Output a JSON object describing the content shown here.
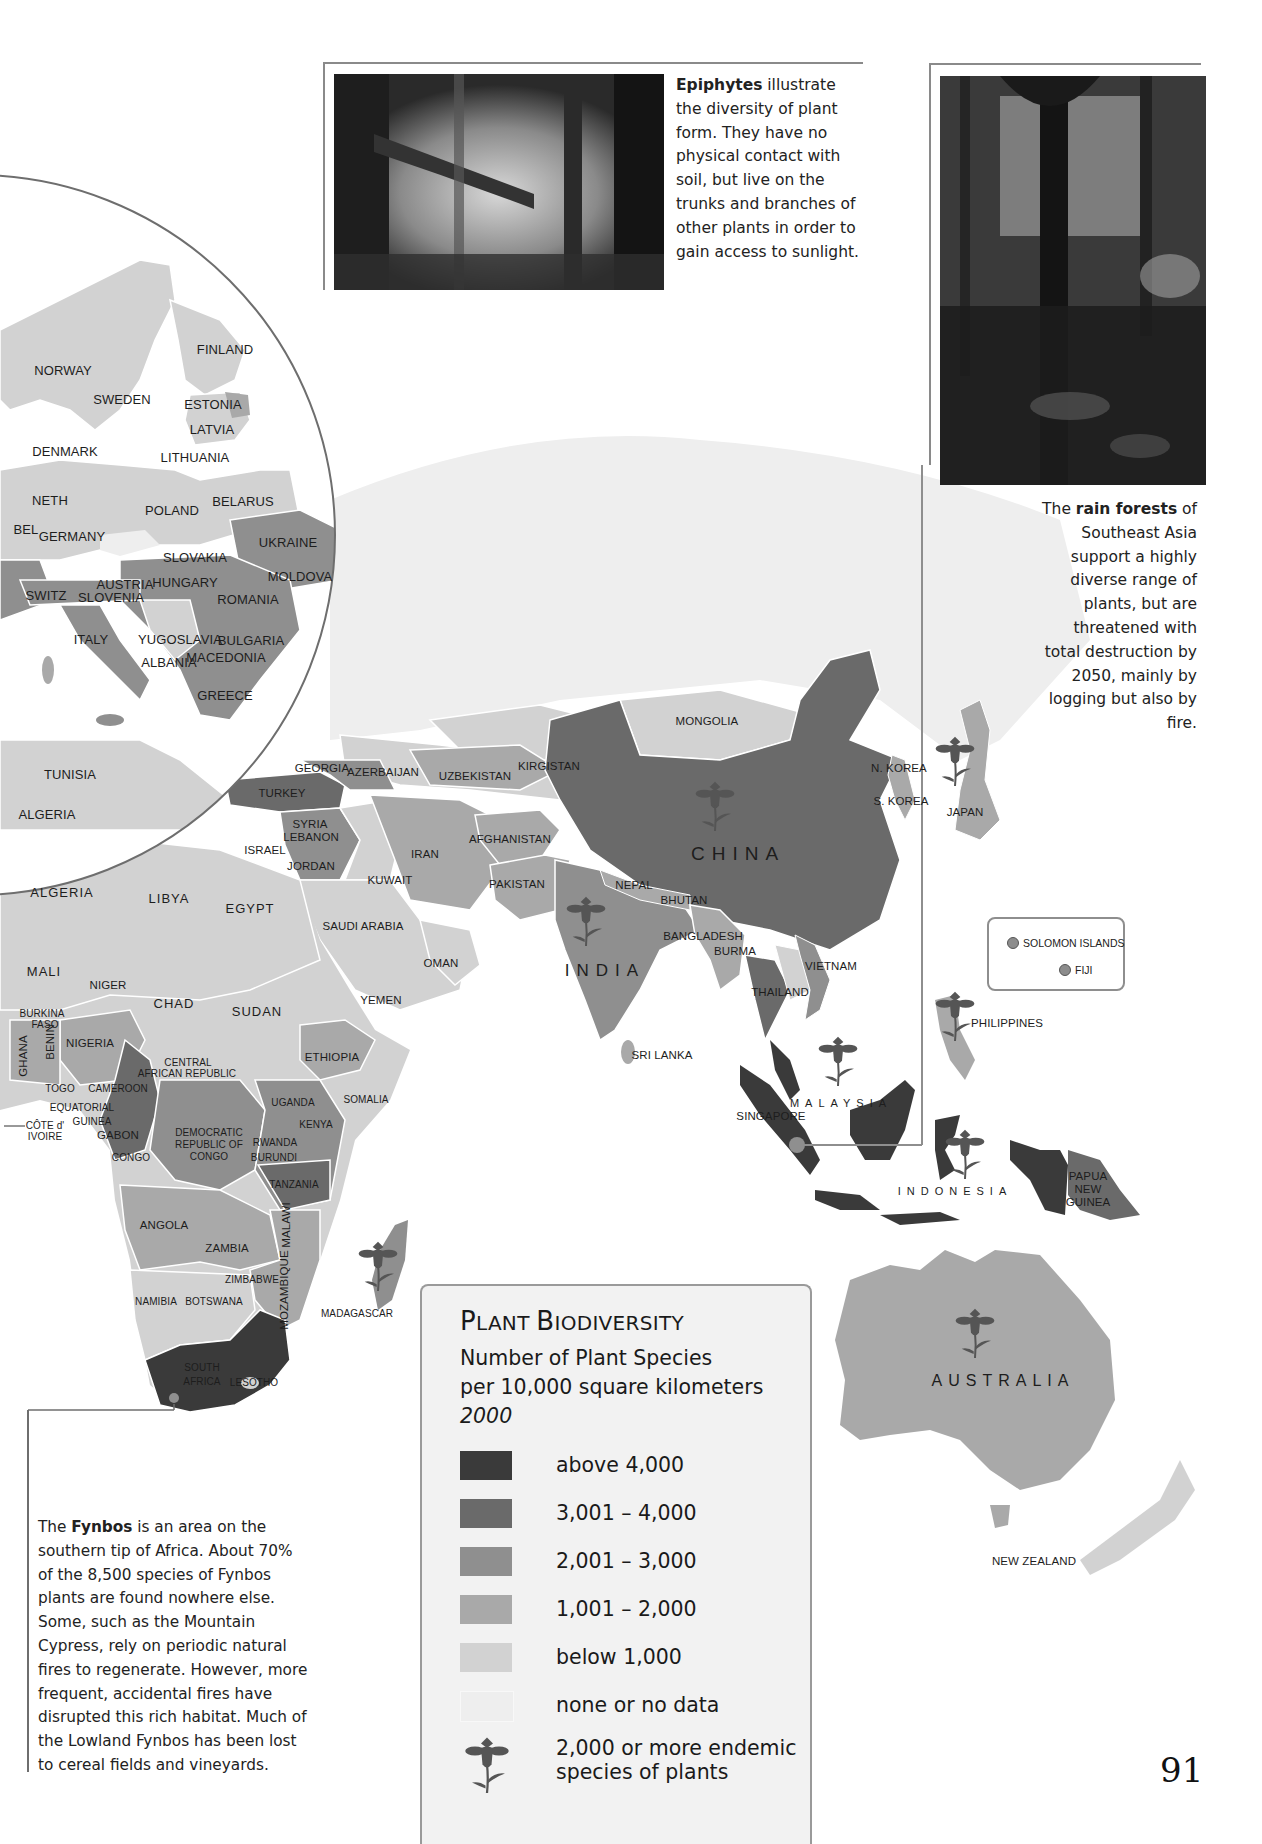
{
  "page": {
    "number": "91"
  },
  "colors": {
    "above_4000": "#3a3a3a",
    "r3001_4000": "#6a6a6a",
    "r2001_3000": "#8f8f8f",
    "r1001_2000": "#a9a9a9",
    "below_1000": "#d2d2d2",
    "no_data": "#eeeeee",
    "flower": "#555555",
    "ocean": "#ffffff",
    "border": "#ffffff"
  },
  "captions": {
    "epiphytes": {
      "bold": "Epiphytes",
      "text": " illustrate the diversity of plant form. They have no physical contact with soil, but live on the trunks and branches of other plants in order to gain access to sunlight."
    },
    "rainforests": {
      "pre": "The ",
      "bold": "rain forests",
      "text": " of Southeast Asia support a highly diverse range of plants, but are threatened with total destruction by 2050, mainly by logging but also by fire."
    },
    "fynbos": {
      "pre": "The ",
      "bold": "Fynbos",
      "text": " is an area on the southern tip of Africa. About 70% of the 8,500 species of Fynbos plants are found nowhere else. Some, such as the Mountain Cypress, rely on periodic natural fires to regenerate. However, more frequent, accidental fires have disrupted this rich habitat. Much of the Lowland Fynbos has been lost to cereal fields and vineyards."
    }
  },
  "photos": {
    "epiphytes": {
      "alt": "Misty forest with epiphytes on tree branches"
    },
    "rainforest": {
      "alt": "Dense Southeast Asian rain forest"
    }
  },
  "legend": {
    "title_cap1": "P",
    "title_rest1": "LANT ",
    "title_cap2": "B",
    "title_rest2": "IODIVERSITY",
    "subtitle1": "Number of Plant Species",
    "subtitle2": "per 10,000 square kilometers",
    "year": "2000",
    "items": [
      {
        "label": "above 4,000",
        "color": "#3a3a3a"
      },
      {
        "label": "3,001 – 4,000",
        "color": "#6a6a6a"
      },
      {
        "label": "2,001 – 3,000",
        "color": "#8f8f8f"
      },
      {
        "label": "1,001 – 2,000",
        "color": "#a9a9a9"
      },
      {
        "label": "below 1,000",
        "color": "#d2d2d2"
      },
      {
        "label": "none or no data",
        "color": "#eeeeee"
      }
    ],
    "endemic_label_1": "2,000 or more endemic",
    "endemic_label_2": "species of plants"
  },
  "inset": {
    "items": [
      {
        "label": "SOLOMON ISLANDS"
      },
      {
        "label": "FIJI"
      }
    ]
  },
  "map": {
    "europe_labels": [
      {
        "text": "FINLAND",
        "x": 225,
        "y": 350
      },
      {
        "text": "NORWAY",
        "x": 63,
        "y": 371
      },
      {
        "text": "SWEDEN",
        "x": 122,
        "y": 400
      },
      {
        "text": "ESTONIA",
        "x": 213,
        "y": 405
      },
      {
        "text": "LATVIA",
        "x": 212,
        "y": 430
      },
      {
        "text": "LITHUANIA",
        "x": 195,
        "y": 458
      },
      {
        "text": "DENMARK",
        "x": 65,
        "y": 452
      },
      {
        "text": "NETH",
        "x": 50,
        "y": 501
      },
      {
        "text": "POLAND",
        "x": 172,
        "y": 511
      },
      {
        "text": "BELARUS",
        "x": 243,
        "y": 502
      },
      {
        "text": "BEL",
        "x": 26,
        "y": 530
      },
      {
        "text": "GERMANY",
        "x": 72,
        "y": 537
      },
      {
        "text": "UKRAINE",
        "x": 288,
        "y": 543
      },
      {
        "text": "SLOVAKIA",
        "x": 195,
        "y": 558
      },
      {
        "text": "AUSTRIA",
        "x": 125,
        "y": 585
      },
      {
        "text": "HUNGARY",
        "x": 185,
        "y": 583
      },
      {
        "text": "MOLDOVA",
        "x": 300,
        "y": 577
      },
      {
        "text": "SWITZ",
        "x": 46,
        "y": 596
      },
      {
        "text": "SLOVENIA",
        "x": 111,
        "y": 598
      },
      {
        "text": "ROMANIA",
        "x": 248,
        "y": 600
      },
      {
        "text": "ITALY",
        "x": 91,
        "y": 640
      },
      {
        "text": "YUGOSLAVIA",
        "x": 180,
        "y": 640
      },
      {
        "text": "BULGARIA",
        "x": 251,
        "y": 641
      },
      {
        "text": "ALBANIA",
        "x": 169,
        "y": 663
      },
      {
        "text": "MACEDONIA",
        "x": 226,
        "y": 658
      },
      {
        "text": "GREECE",
        "x": 225,
        "y": 696
      },
      {
        "text": "TUNISIA",
        "x": 70,
        "y": 775
      },
      {
        "text": "ALGERIA",
        "x": 47,
        "y": 815
      }
    ],
    "labels": [
      {
        "text": "GEORGIA",
        "x": 322,
        "y": 768,
        "size": "small"
      },
      {
        "text": "AZERBAIJAN",
        "x": 383,
        "y": 772,
        "size": "small"
      },
      {
        "text": "UZBEKISTAN",
        "x": 475,
        "y": 776,
        "size": "small"
      },
      {
        "text": "KIRGISTAN",
        "x": 549,
        "y": 766,
        "size": "small"
      },
      {
        "text": "MONGOLIA",
        "x": 707,
        "y": 721,
        "size": "small"
      },
      {
        "text": "N. KOREA",
        "x": 899,
        "y": 768,
        "size": "small"
      },
      {
        "text": "S. KOREA",
        "x": 901,
        "y": 801,
        "size": "small"
      },
      {
        "text": "JAPAN",
        "x": 965,
        "y": 812,
        "size": "small"
      },
      {
        "text": "TURKEY",
        "x": 282,
        "y": 793,
        "size": "small"
      },
      {
        "text": "SYRIA",
        "x": 310,
        "y": 824,
        "size": "small"
      },
      {
        "text": "LEBANON",
        "x": 311,
        "y": 837,
        "size": "small"
      },
      {
        "text": "ISRAEL",
        "x": 265,
        "y": 850,
        "size": "small"
      },
      {
        "text": "JORDAN",
        "x": 311,
        "y": 866,
        "size": "small"
      },
      {
        "text": "IRAN",
        "x": 425,
        "y": 854,
        "size": "small"
      },
      {
        "text": "AFGHANISTAN",
        "x": 510,
        "y": 839,
        "size": "small"
      },
      {
        "text": "KUWAIT",
        "x": 390,
        "y": 880,
        "size": "small"
      },
      {
        "text": "PAKISTAN",
        "x": 517,
        "y": 884,
        "size": "small"
      },
      {
        "text": "NEPAL",
        "x": 634,
        "y": 885,
        "size": "small"
      },
      {
        "text": "BHUTAN",
        "x": 684,
        "y": 900,
        "size": "small"
      },
      {
        "text": "CHINA",
        "x": 738,
        "y": 854,
        "size": "major"
      },
      {
        "text": "INDIA",
        "x": 605,
        "y": 971,
        "size": "major2"
      },
      {
        "text": "SAUDI ARABIA",
        "x": 363,
        "y": 926,
        "size": "small"
      },
      {
        "text": "OMAN",
        "x": 441,
        "y": 963,
        "size": "small"
      },
      {
        "text": "YEMEN",
        "x": 381,
        "y": 1000,
        "size": "small"
      },
      {
        "text": "BANGLADESH",
        "x": 703,
        "y": 936,
        "size": "small"
      },
      {
        "text": "BURMA",
        "x": 735,
        "y": 951,
        "size": "small"
      },
      {
        "text": "VIETNAM",
        "x": 831,
        "y": 966,
        "size": "small"
      },
      {
        "text": "THAILAND",
        "x": 780,
        "y": 992,
        "size": "small"
      },
      {
        "text": "SRI LANKA",
        "x": 662,
        "y": 1055,
        "size": "small"
      },
      {
        "text": "PHILIPPINES",
        "x": 1007,
        "y": 1023,
        "size": "small"
      },
      {
        "text": "MALAYSIA",
        "x": 841,
        "y": 1103,
        "size": "spaced"
      },
      {
        "text": "SINGAPORE",
        "x": 771,
        "y": 1116,
        "size": "small"
      },
      {
        "text": "INDONESIA",
        "x": 955,
        "y": 1191,
        "size": "spaced"
      },
      {
        "text": "PAPUA",
        "x": 1088,
        "y": 1176,
        "size": "small"
      },
      {
        "text": "NEW",
        "x": 1088,
        "y": 1189,
        "size": "small"
      },
      {
        "text": "GUINEA",
        "x": 1088,
        "y": 1202,
        "size": "small"
      },
      {
        "text": "AUSTRALIA",
        "x": 1003,
        "y": 1381,
        "size": "major3"
      },
      {
        "text": "NEW ZEALAND",
        "x": 1034,
        "y": 1561,
        "size": "small"
      },
      {
        "text": "ALGERIA",
        "x": 62,
        "y": 893,
        "size": "big"
      },
      {
        "text": "LIBYA",
        "x": 169,
        "y": 899,
        "size": "big"
      },
      {
        "text": "EGYPT",
        "x": 250,
        "y": 909,
        "size": "big"
      },
      {
        "text": "MALI",
        "x": 44,
        "y": 972,
        "size": "big"
      },
      {
        "text": "NIGER",
        "x": 108,
        "y": 985,
        "size": "small"
      },
      {
        "text": "CHAD",
        "x": 174,
        "y": 1004,
        "size": "big"
      },
      {
        "text": "SUDAN",
        "x": 257,
        "y": 1012,
        "size": "big"
      },
      {
        "text": "BURKINA",
        "x": 42,
        "y": 1014,
        "size": "tiny"
      },
      {
        "text": "FASO",
        "x": 45,
        "y": 1025,
        "size": "tiny"
      },
      {
        "text": "NIGERIA",
        "x": 90,
        "y": 1043,
        "size": "small"
      },
      {
        "text": "ETHIOPIA",
        "x": 332,
        "y": 1057,
        "size": "small"
      },
      {
        "text": "CENTRAL",
        "x": 188,
        "y": 1063,
        "size": "tiny"
      },
      {
        "text": "AFRICAN REPUBLIC",
        "x": 187,
        "y": 1074,
        "size": "tiny"
      },
      {
        "text": "TOGO",
        "x": 60,
        "y": 1089,
        "size": "tiny"
      },
      {
        "text": "CAMEROON",
        "x": 118,
        "y": 1089,
        "size": "tiny"
      },
      {
        "text": "EQUATORIAL",
        "x": 82,
        "y": 1108,
        "size": "tiny"
      },
      {
        "text": "GUINEA",
        "x": 92,
        "y": 1122,
        "size": "tiny"
      },
      {
        "text": "GABON",
        "x": 118,
        "y": 1135,
        "size": "small"
      },
      {
        "text": "CÔTE d'",
        "x": 45,
        "y": 1126,
        "size": "tiny"
      },
      {
        "text": "IVOIRE",
        "x": 45,
        "y": 1137,
        "size": "tiny"
      },
      {
        "text": "UGANDA",
        "x": 293,
        "y": 1103,
        "size": "tiny"
      },
      {
        "text": "SOMALIA",
        "x": 366,
        "y": 1100,
        "size": "tiny"
      },
      {
        "text": "KENYA",
        "x": 316,
        "y": 1125,
        "size": "tiny"
      },
      {
        "text": "DEMOCRATIC",
        "x": 209,
        "y": 1133,
        "size": "tiny"
      },
      {
        "text": "REPUBLIC OF",
        "x": 209,
        "y": 1145,
        "size": "tiny"
      },
      {
        "text": "CONGO",
        "x": 209,
        "y": 1157,
        "size": "tiny"
      },
      {
        "text": "RWANDA",
        "x": 275,
        "y": 1143,
        "size": "tiny"
      },
      {
        "text": "BURUNDI",
        "x": 274,
        "y": 1158,
        "size": "tiny"
      },
      {
        "text": "CONGO",
        "x": 131,
        "y": 1158,
        "size": "tiny"
      },
      {
        "text": "TANZANIA",
        "x": 294,
        "y": 1185,
        "size": "tiny"
      },
      {
        "text": "ANGOLA",
        "x": 164,
        "y": 1225,
        "size": "small"
      },
      {
        "text": "ZAMBIA",
        "x": 227,
        "y": 1248,
        "size": "small"
      },
      {
        "text": "ZIMBABWE",
        "x": 252,
        "y": 1280,
        "size": "tiny"
      },
      {
        "text": "NAMIBIA",
        "x": 156,
        "y": 1302,
        "size": "tiny"
      },
      {
        "text": "BOTSWANA",
        "x": 214,
        "y": 1302,
        "size": "tiny"
      },
      {
        "text": "MADAGASCAR",
        "x": 357,
        "y": 1314,
        "size": "tiny"
      },
      {
        "text": "SOUTH",
        "x": 202,
        "y": 1368,
        "size": "tiny"
      },
      {
        "text": "AFRICA",
        "x": 202,
        "y": 1382,
        "size": "tiny"
      },
      {
        "text": "LESOTHO",
        "x": 254,
        "y": 1383,
        "size": "tiny"
      }
    ],
    "vertical_labels": [
      {
        "text": "GHANA",
        "x": 23,
        "y": 1056
      },
      {
        "text": "BENIN",
        "x": 50,
        "y": 1042
      },
      {
        "text": "MALAWI",
        "x": 286,
        "y": 1225
      },
      {
        "text": "MOZAMBIQUE",
        "x": 284,
        "y": 1290
      }
    ]
  }
}
